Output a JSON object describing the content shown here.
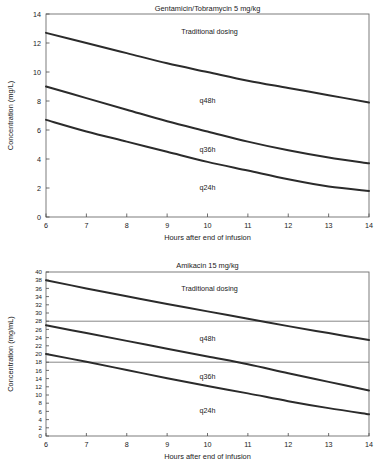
{
  "chart_data": [
    {
      "id": "gentamicin",
      "type": "line",
      "title": "Gentamicin/Tobramycin 5 mg/kg",
      "xlabel": "Hours after end of infusion",
      "ylabel": "Concentration (mg/L)",
      "xlim": [
        6,
        14
      ],
      "ylim": [
        0,
        14
      ],
      "xticks": [
        6,
        7,
        8,
        9,
        10,
        11,
        12,
        13,
        14
      ],
      "yticks": [
        0,
        2,
        4,
        6,
        8,
        10,
        12,
        14
      ],
      "xtick_labels": [
        "6",
        "7",
        "8",
        "9",
        "10",
        "11",
        "12",
        "13",
        "14"
      ],
      "ytick_labels": [
        "0",
        "2",
        "4",
        "6",
        "8",
        "10",
        "12",
        "14"
      ],
      "grid": false,
      "legend": "inline-annotations",
      "reference_lines": [],
      "x": [
        6,
        7,
        8,
        9,
        10,
        11,
        12,
        13,
        14
      ],
      "series": [
        {
          "name": "Traditional dosing",
          "values": [
            12.7,
            12.0,
            11.3,
            10.6,
            10.0,
            9.4,
            8.9,
            8.4,
            7.9
          ],
          "label_x": 10.05,
          "label_y": 12.6
        },
        {
          "name": "q48h",
          "values": [
            9.0,
            8.2,
            7.4,
            6.6,
            5.9,
            5.2,
            4.6,
            4.1,
            3.7
          ],
          "label_x": 10.0,
          "label_y": 7.85
        },
        {
          "name": "q36h",
          "values": [
            6.7,
            5.9,
            5.2,
            4.5,
            3.8,
            3.2,
            2.6,
            2.1,
            1.8
          ],
          "label_x": 10.0,
          "label_y": 4.5
        },
        {
          "name": "q24h",
          "values": [],
          "label_x": 10.0,
          "label_y": 1.85,
          "label_only": true
        }
      ]
    },
    {
      "id": "amikacin",
      "type": "line",
      "title": "Amikacin 15 mg/kg",
      "xlabel": "Hours after end of infusion",
      "ylabel": "Concentration (mg/mL)",
      "xlim": [
        6,
        14
      ],
      "ylim": [
        0,
        40
      ],
      "xticks": [
        6,
        7,
        8,
        9,
        10,
        11,
        12,
        13,
        14
      ],
      "yticks": [
        0,
        2,
        4,
        6,
        8,
        10,
        12,
        14,
        16,
        18,
        20,
        22,
        24,
        26,
        28,
        30,
        32,
        34,
        36,
        38,
        40
      ],
      "xtick_labels": [
        "6",
        "7",
        "8",
        "9",
        "10",
        "11",
        "12",
        "13",
        "14"
      ],
      "ytick_labels": [
        "0",
        "2",
        "4",
        "6",
        "8",
        "10",
        "12",
        "14",
        "16",
        "18",
        "20",
        "22",
        "24",
        "26",
        "28",
        "30",
        "32",
        "34",
        "36",
        "38",
        "40"
      ],
      "grid": false,
      "legend": "inline-annotations",
      "reference_lines": [
        28,
        18
      ],
      "x": [
        6,
        7,
        8,
        9,
        10,
        11,
        12,
        13,
        14
      ],
      "series": [
        {
          "name": "Traditional dosing",
          "values": [
            38.0,
            36.0,
            34.1,
            32.2,
            30.4,
            28.6,
            26.8,
            25.1,
            23.4
          ],
          "label_x": 10.05,
          "label_y": 35.3
        },
        {
          "name": "q48h",
          "values": [
            27.0,
            25.1,
            23.2,
            21.3,
            19.4,
            17.5,
            15.3,
            13.2,
            11.1
          ],
          "label_x": 10.0,
          "label_y": 23.2
        },
        {
          "name": "q36h",
          "values": [
            20.0,
            18.1,
            16.1,
            14.1,
            12.2,
            10.4,
            8.5,
            6.8,
            5.3
          ],
          "label_x": 10.0,
          "label_y": 13.9
        },
        {
          "name": "q24h",
          "values": [],
          "label_x": 10.0,
          "label_y": 5.6,
          "label_only": true
        }
      ]
    }
  ],
  "colors": {
    "curve": "#2b2b2b",
    "frame": "#6e6e6e",
    "text": "#1a1a1a",
    "reference_line": "#555555",
    "background": "#ffffff"
  }
}
